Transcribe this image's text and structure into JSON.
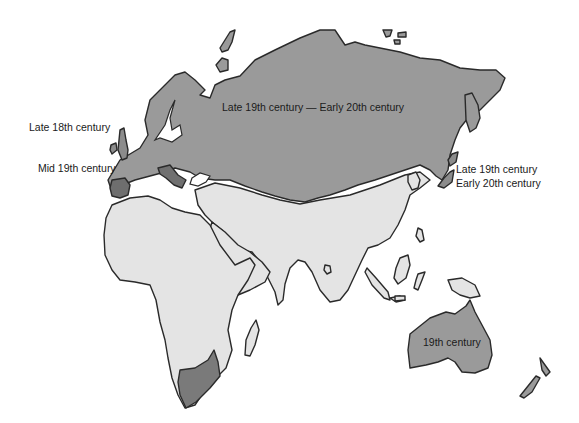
{
  "map": {
    "colors": {
      "russia_late19_early20": "#9a9a9a",
      "late18": "#8c8c8c",
      "mid19": "#6e6e6e",
      "century19": "#9a9a9a",
      "uncolonized_light": "#e4e4e4",
      "background": "#ffffff",
      "outline": "#2a2a2a"
    },
    "legend_labels": {
      "russia": "Late 19th century — Early 20th century",
      "britain": "Late 18th century",
      "iberia_mid19": "Mid 19th century",
      "japan_line1": "Late 19th century",
      "japan_line2": "Early 20th century",
      "australia": "19th century"
    },
    "regions": [
      {
        "name": "Russia / Siberia",
        "period": "Late 19th century — Early 20th century"
      },
      {
        "name": "British Isles",
        "period": "Late 18th century"
      },
      {
        "name": "Iberia",
        "period": "Mid 19th century"
      },
      {
        "name": "Japan",
        "period": "Late 19th century — Early 20th century"
      },
      {
        "name": "Australia",
        "period": "19th century"
      },
      {
        "name": "New Zealand",
        "period": "19th century"
      },
      {
        "name": "South Africa",
        "period": "Mid 19th century"
      },
      {
        "name": "Africa",
        "period": "none"
      },
      {
        "name": "Arabia / Middle East",
        "period": "none"
      },
      {
        "name": "South & East Asia",
        "period": "none"
      }
    ]
  }
}
